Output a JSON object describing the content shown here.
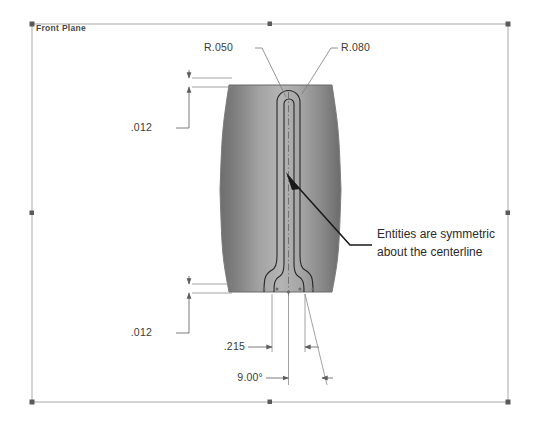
{
  "view": {
    "plane_label": "Front Plane",
    "background_color": "#ffffff",
    "part_fill_dark": "#6f6f6f",
    "part_fill_light": "#b9b9b9",
    "edge_color": "#262626",
    "dimension_color": "#3a3a3a"
  },
  "dimensions": [
    {
      "id": "top-offset",
      "label": ".012",
      "type": "linear-vertical"
    },
    {
      "id": "bottom-offset",
      "label": ".012",
      "type": "linear-vertical"
    },
    {
      "id": "slot-width",
      "label": ".215",
      "type": "linear-horizontal"
    },
    {
      "id": "draft-angle",
      "label": "9.00°",
      "type": "angular"
    },
    {
      "id": "inner-radius",
      "label": "R.050",
      "type": "radial"
    },
    {
      "id": "outer-radius",
      "label": "R.080",
      "type": "radial"
    }
  ],
  "annotations": [
    {
      "id": "symmetry-note",
      "line1": "Entities are symmetric",
      "line2": "about the centerline"
    }
  ]
}
